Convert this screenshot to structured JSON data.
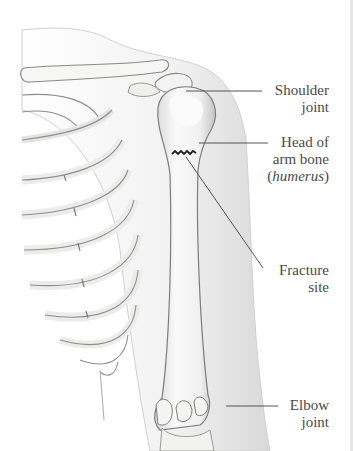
{
  "diagram": {
    "labels": [
      {
        "id": "shoulder-joint",
        "line1": "Shoulder",
        "line2": "joint"
      },
      {
        "id": "head-of-arm-bone",
        "line1": "Head of",
        "line2": "arm bone",
        "line3_open": "(",
        "line3_italic": "humerus",
        "line3_close": ")"
      },
      {
        "id": "fracture-site",
        "line1": "Fracture",
        "line2": "site"
      },
      {
        "id": "elbow-joint",
        "line1": "Elbow",
        "line2": "joint"
      }
    ],
    "colors": {
      "bone_fill": "#f4f4f2",
      "bone_outline": "#8a8a8a",
      "shadow": "#b9b9b9",
      "skin_outline": "#c8c8c8",
      "label_text": "#4a4a4a",
      "leader_line": "#555555",
      "fracture_line": "#222222"
    }
  }
}
